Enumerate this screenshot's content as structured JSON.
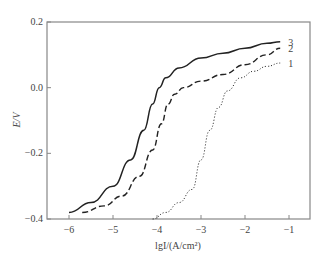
{
  "chart_data": {
    "type": "line",
    "title": "",
    "xlabel": "lgI/(A/cm²)",
    "ylabel": "E/V",
    "xlim": [
      -6.5,
      -0.5
    ],
    "ylim": [
      -0.4,
      0.2
    ],
    "x_ticks": [
      -6,
      -5,
      -4,
      -3,
      -2,
      -1
    ],
    "x_tick_labels": [
      "−6",
      "−5",
      "−4",
      "−3",
      "−2",
      "−1"
    ],
    "y_ticks": [
      0.2,
      0.0,
      -0.2,
      -0.4
    ],
    "y_tick_labels": [
      "0.2",
      "0.0",
      "−0.2",
      "−0.4"
    ],
    "grid": false,
    "legend_position": "inline-right",
    "series": [
      {
        "name": "3",
        "style": "solid",
        "points": [
          [
            -6.0,
            -0.38
          ],
          [
            -5.5,
            -0.35
          ],
          [
            -5.0,
            -0.3
          ],
          [
            -4.6,
            -0.22
          ],
          [
            -4.3,
            -0.13
          ],
          [
            -4.1,
            -0.05
          ],
          [
            -3.95,
            0.0
          ],
          [
            -3.8,
            0.03
          ],
          [
            -3.5,
            0.06
          ],
          [
            -3.0,
            0.09
          ],
          [
            -2.5,
            0.105
          ],
          [
            -2.0,
            0.12
          ],
          [
            -1.5,
            0.135
          ],
          [
            -1.2,
            0.14
          ]
        ]
      },
      {
        "name": "2",
        "style": "dashed",
        "points": [
          [
            -5.7,
            -0.38
          ],
          [
            -5.2,
            -0.36
          ],
          [
            -4.8,
            -0.33
          ],
          [
            -4.4,
            -0.27
          ],
          [
            -4.1,
            -0.19
          ],
          [
            -3.9,
            -0.11
          ],
          [
            -3.75,
            -0.05
          ],
          [
            -3.6,
            -0.02
          ],
          [
            -3.4,
            0.0
          ],
          [
            -3.0,
            0.02
          ],
          [
            -2.5,
            0.04
          ],
          [
            -2.0,
            0.07
          ],
          [
            -1.5,
            0.1
          ],
          [
            -1.2,
            0.12
          ]
        ]
      },
      {
        "name": "1",
        "style": "dotted",
        "points": [
          [
            -4.1,
            -0.4
          ],
          [
            -3.8,
            -0.38
          ],
          [
            -3.5,
            -0.35
          ],
          [
            -3.2,
            -0.31
          ],
          [
            -3.0,
            -0.22
          ],
          [
            -2.8,
            -0.13
          ],
          [
            -2.6,
            -0.06
          ],
          [
            -2.4,
            -0.01
          ],
          [
            -2.1,
            0.03
          ],
          [
            -1.8,
            0.05
          ],
          [
            -1.5,
            0.065
          ],
          [
            -1.2,
            0.075
          ]
        ]
      }
    ]
  }
}
